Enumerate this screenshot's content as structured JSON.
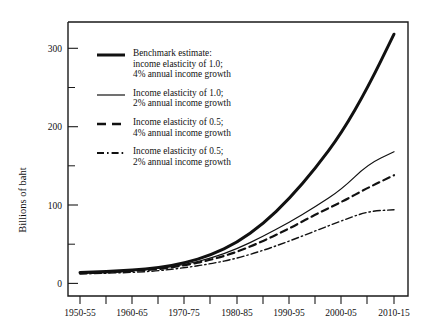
{
  "chart_data": {
    "type": "line",
    "title": "",
    "xlabel": "",
    "ylabel": "Billions of baht",
    "ylim": [
      0,
      340
    ],
    "yticks": [
      0,
      100,
      200,
      300
    ],
    "ytick_labels": [
      "0",
      "100",
      "200",
      "300"
    ],
    "yminor_ticks": [
      50,
      150,
      250
    ],
    "grid": false,
    "legend_position": "upper-left-inside",
    "categories": [
      "1950-55",
      "1955-60",
      "1960-65",
      "1965-70",
      "1970-75",
      "1975-80",
      "1980-85",
      "1985-90",
      "1990-95",
      "1995-2000",
      "2000-05",
      "2005-10",
      "2010-15"
    ],
    "xtick_labels_shown": [
      "1950-55",
      "1960-65",
      "1970-75",
      "1980-85",
      "1990-95",
      "2000-05",
      "2010-15"
    ],
    "series": [
      {
        "name": "Benchmark estimate: income elasticity of 1.0; 4% annual income growth",
        "style": "thick-solid",
        "values": [
          14,
          15,
          17,
          20,
          26,
          36,
          52,
          76,
          108,
          147,
          192,
          250,
          318
        ]
      },
      {
        "name": "Income elasticity of 1.0; 2% annual income growth",
        "style": "thin-solid",
        "values": [
          13,
          14,
          16,
          19,
          24,
          32,
          44,
          60,
          78,
          98,
          120,
          152,
          168
        ]
      },
      {
        "name": "Income elasticity of 0.5; 4% annual income growth",
        "style": "dashed",
        "values": [
          13,
          14,
          16,
          18,
          23,
          30,
          40,
          54,
          70,
          88,
          104,
          122,
          138
        ]
      },
      {
        "name": "Income elasticity of 0.5; 2% annual income growth",
        "style": "dash-dot",
        "values": [
          12,
          13,
          14,
          16,
          20,
          25,
          32,
          42,
          54,
          67,
          80,
          92,
          94
        ]
      }
    ]
  },
  "legend": {
    "items": [
      {
        "swatch": "thick-solid-line-icon",
        "label": "Benchmark estimate:\nincome elasticity of 1.0;\n4% annual income growth"
      },
      {
        "swatch": "thin-solid-line-icon",
        "label": "Income elasticity of 1.0;\n2% annual income growth"
      },
      {
        "swatch": "dashed-line-icon",
        "label": "Income elasticity of 0.5;\n4% annual income growth"
      },
      {
        "swatch": "dash-dot-line-icon",
        "label": "Income elasticity of 0.5;\n2% annual income growth"
      }
    ]
  },
  "axes": {
    "y_title": "Billions of baht",
    "y_labels": [
      "300",
      "200",
      "100",
      "0"
    ],
    "x_labels": [
      "1950-55",
      "1960-65",
      "1970-75",
      "1980-85",
      "1990-95",
      "2000-05",
      "2010-15"
    ]
  },
  "colors": {
    "ink": "#111111",
    "background": "#ffffff"
  }
}
